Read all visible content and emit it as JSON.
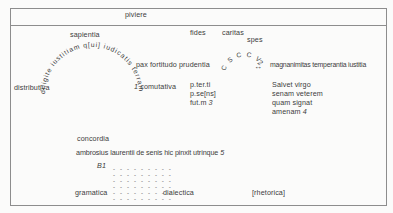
{
  "figure": {
    "top_band_label": "piviere",
    "upper": {
      "sapientia": "sapientia",
      "fides": "fides",
      "caritas": "caritas",
      "spes": "spes",
      "arch_inscription": "diligite iustitiam q[ui] iudicatis terram",
      "virtues_left": "pax fortitudo prudentia",
      "monogram": "C S C C V",
      "monogram_footnote": "2",
      "arrow_symbol": "↔",
      "virtues_right": "magnanimitas temperantia iustitia",
      "distributiva": "distributiva",
      "comutativa_footnote": "1",
      "comutativa": "comutativa",
      "tituli": [
        "p.ter.ti",
        "p.se[ns]",
        "fut.m"
      ],
      "tituli_footnote": "3",
      "salvet_lines": [
        "Salvet virgo",
        "senam veterem",
        "quam signat",
        "amenam"
      ],
      "salvet_footnote": "4"
    },
    "lower": {
      "concordia": "concordia",
      "signature": "ambrosius laurentii de senis hic pinxit utrinque",
      "signature_footnote": "5",
      "b1_label": "B1",
      "dash_row": "- - - - - - - - -",
      "gramatica": "gramatica",
      "dialectica": "dialectica",
      "rhetorica": "[rhetorica]"
    },
    "colors": {
      "line": "#8d8d8d",
      "text": "#3c3c3c",
      "background": "#fbfbfa"
    }
  }
}
